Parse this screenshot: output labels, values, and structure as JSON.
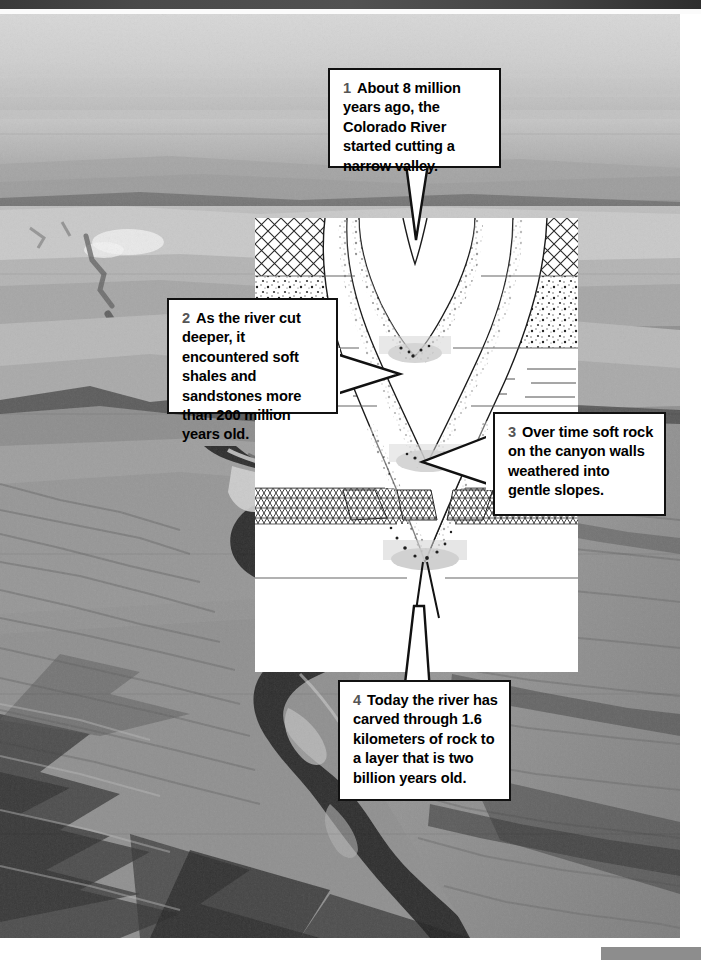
{
  "figure": {
    "background_photo": "aerial-photograph-colorado-river-canyon"
  },
  "callouts": [
    {
      "id": "callout-1",
      "number": "1",
      "text": "About 8 million years ago, the Colorado River started cutting a narrow valley.",
      "tail_direction": "down"
    },
    {
      "id": "callout-2",
      "number": "2",
      "text": "As the river cut deeper, it encountered soft shales and sandstones more than 200 million years old.",
      "tail_direction": "right"
    },
    {
      "id": "callout-3",
      "number": "3",
      "text": "Over time soft rock on the canyon walls weathered into gentle slopes.",
      "tail_direction": "left"
    },
    {
      "id": "callout-4",
      "number": "4",
      "text": "Today the river has carved through 1.6 kilometers of rock to a layer that is two billion years old.",
      "tail_direction": "up"
    }
  ],
  "diagram": {
    "name": "canyon-cross-section",
    "strata": [
      {
        "index": 0,
        "texture": "cross-hatch",
        "label": "limestone"
      },
      {
        "index": 1,
        "texture": "stipple",
        "label": "sandstone"
      },
      {
        "index": 2,
        "texture": "horizontal-lines",
        "label": "shale"
      },
      {
        "index": 3,
        "texture": "blank",
        "label": "sandstone"
      },
      {
        "index": 4,
        "texture": "diagonal-hatch",
        "label": "limestone"
      },
      {
        "index": 5,
        "texture": "blank",
        "label": "shale"
      },
      {
        "index": 6,
        "texture": "blank",
        "label": "basement rock"
      }
    ],
    "stage_count": 4
  },
  "colors": {
    "callout_border": "#111111",
    "callout_fill": "#ffffff",
    "callout_number": "#555555",
    "panel_fill": "#ffffff",
    "top_bar": "#474747",
    "bottom_tab": "#8d8d8d"
  }
}
